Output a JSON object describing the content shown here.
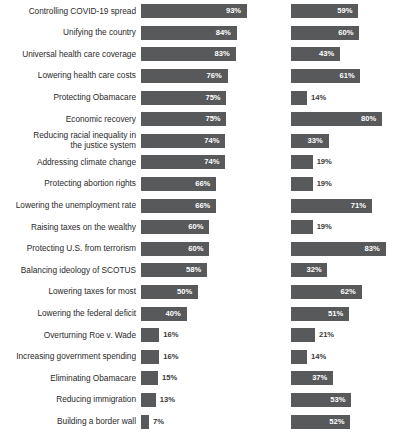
{
  "chart_data": {
    "type": "bar",
    "title": "",
    "subtitle": "",
    "xlabel": "",
    "ylabel": "",
    "orientation": "horizontal",
    "grid": false,
    "legend": null,
    "xlim": [
      0,
      100
    ],
    "value_suffix": "%",
    "categories": [
      "Controlling COVID-19 spread",
      "Unifying the country",
      "Universal health care coverage",
      "Lowering health care costs",
      "Protecting Obamacare",
      "Economic recovery",
      "Reducing racial inequality in\nthe justice system",
      "Addressing climate change",
      "Protecting abortion rights",
      "Lowering the unemployment rate",
      "Raising taxes on the wealthy",
      "Protecting U.S. from terrorism",
      "Balancing ideology of SCOTUS",
      "Lowering taxes for most",
      "Lowering the federal deficit",
      "Overturning Roe v. Wade",
      "Increasing government spending",
      "Eliminating Obamacare",
      "Reducing immigration",
      "Building a border wall"
    ],
    "series": [
      {
        "name": "left",
        "values": [
          93,
          84,
          83,
          76,
          75,
          75,
          74,
          74,
          66,
          66,
          60,
          60,
          58,
          50,
          40,
          16,
          16,
          15,
          13,
          7
        ],
        "labels": [
          "93%",
          "84%",
          "83%",
          "76%",
          "75%",
          "75%",
          "74%",
          "74%",
          "66%",
          "66%",
          "60%",
          "60%",
          "58%",
          "50%",
          "40%",
          "16%",
          "16%",
          "15%",
          "13%",
          "7%"
        ]
      },
      {
        "name": "right",
        "values": [
          59,
          60,
          43,
          61,
          14,
          80,
          33,
          19,
          19,
          71,
          19,
          83,
          32,
          62,
          51,
          21,
          14,
          37,
          53,
          52
        ],
        "labels": [
          "59%",
          "60%",
          "43%",
          "61%",
          "14%",
          "80%",
          "33%",
          "19%",
          "19%",
          "71%",
          "19%",
          "83%",
          "32%",
          "62%",
          "51%",
          "21%",
          "14%",
          "37%",
          "53%",
          "52%"
        ]
      }
    ],
    "colors": {
      "bar": "#58595b",
      "value_inside": "#ffffff",
      "value_outside": "#3a3a3a",
      "label": "#2b2b2b",
      "background": "#ffffff"
    }
  }
}
